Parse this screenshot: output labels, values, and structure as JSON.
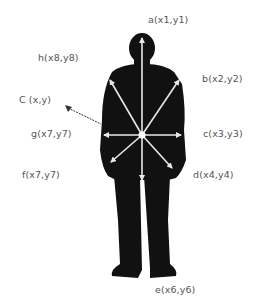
{
  "diagram": {
    "center": {
      "x": 142,
      "y": 135
    },
    "labels": {
      "a": "a(x1,y1)",
      "b": "b(x2,y2)",
      "c": "c(x3,y3)",
      "d": "d(x4,y4)",
      "e": "e(x6,y6)",
      "f": "f(x7,y7)",
      "g": "g(x7,y7)",
      "h": "h(x8,y8)",
      "center": "C (x,y)"
    },
    "colors": {
      "silhouette": "#111111",
      "arrows": "#e8e8e8",
      "label_text": "#555555",
      "pointer": "#333333"
    }
  }
}
